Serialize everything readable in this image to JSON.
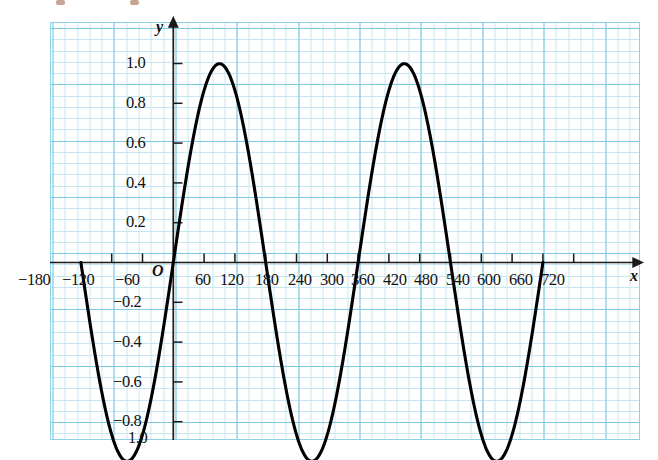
{
  "figure": {
    "axis_names": {
      "x": "x",
      "y": "y"
    },
    "origin_label": "O"
  },
  "chart_data": {
    "type": "line",
    "title": "",
    "subtitle": "",
    "xlabel": "x",
    "ylabel": "y",
    "function": "y = sin(x)",
    "units": "degrees",
    "grid": true,
    "grid_style": "graph-paper",
    "legend": "none",
    "xlim": [
      -180,
      720
    ],
    "ylim": [
      -1.0,
      1.0
    ],
    "xticks": [
      -180,
      -120,
      -60,
      0,
      60,
      120,
      180,
      240,
      300,
      360,
      420,
      480,
      540,
      600,
      660,
      720
    ],
    "xtick_labels": [
      "−180",
      "−120",
      "−60",
      "",
      "60",
      "120",
      "180",
      "240",
      "300",
      "360",
      "420",
      "480",
      "540",
      "600",
      "660",
      "720"
    ],
    "yticks": [
      -1.0,
      -0.8,
      -0.6,
      -0.4,
      -0.2,
      0.2,
      0.4,
      0.6,
      0.8,
      1.0
    ],
    "ytick_labels": [
      "−1.0",
      "−0.8",
      "−0.6",
      "−0.4",
      "−0.2",
      "0.2",
      "0.4",
      "0.6",
      "0.8",
      "1.0"
    ],
    "series": [
      {
        "name": "y = sin(x)",
        "color": "#000000",
        "x": [
          -180,
          -170,
          -160,
          -150,
          -140,
          -130,
          -120,
          -110,
          -100,
          -90,
          -80,
          -70,
          -60,
          -50,
          -40,
          -30,
          -20,
          -10,
          0,
          10,
          20,
          30,
          40,
          50,
          60,
          70,
          80,
          90,
          100,
          110,
          120,
          130,
          140,
          150,
          160,
          170,
          180,
          190,
          200,
          210,
          220,
          230,
          240,
          250,
          260,
          270,
          280,
          290,
          300,
          310,
          320,
          330,
          340,
          350,
          360,
          370,
          380,
          390,
          400,
          410,
          420,
          430,
          440,
          450,
          460,
          470,
          480,
          490,
          500,
          510,
          520,
          530,
          540,
          550,
          560,
          570,
          580,
          590,
          600,
          610,
          620,
          630,
          640,
          650,
          660,
          670,
          680,
          690,
          700,
          710,
          720
        ],
        "y": [
          0.0,
          -0.174,
          -0.342,
          -0.5,
          -0.643,
          -0.766,
          -0.866,
          -0.94,
          -0.985,
          -1.0,
          -0.985,
          -0.94,
          -0.866,
          -0.766,
          -0.643,
          -0.5,
          -0.342,
          -0.174,
          0.0,
          0.174,
          0.342,
          0.5,
          0.643,
          0.766,
          0.866,
          0.94,
          0.985,
          1.0,
          0.985,
          0.94,
          0.866,
          0.766,
          0.643,
          0.5,
          0.342,
          0.174,
          0.0,
          -0.174,
          -0.342,
          -0.5,
          -0.643,
          -0.766,
          -0.866,
          -0.94,
          -0.985,
          -1.0,
          -0.985,
          -0.94,
          -0.866,
          -0.766,
          -0.643,
          -0.5,
          -0.342,
          -0.174,
          0.0,
          0.174,
          0.342,
          0.5,
          0.643,
          0.766,
          0.866,
          0.94,
          0.985,
          1.0,
          0.985,
          0.94,
          0.866,
          0.766,
          0.643,
          0.5,
          0.342,
          0.174,
          0.0,
          -0.174,
          -0.342,
          -0.5,
          -0.643,
          -0.766,
          -0.866,
          -0.94,
          -0.985,
          -1.0,
          -0.985,
          -0.94,
          -0.866,
          -0.766,
          -0.643,
          -0.5,
          -0.342,
          -0.174,
          0.0
        ]
      }
    ],
    "key_points": {
      "maxima": [
        {
          "x": 90,
          "y": 1.0
        },
        {
          "x": 450,
          "y": 1.0
        }
      ],
      "minima": [
        {
          "x": -90,
          "y": -1.0
        },
        {
          "x": 270,
          "y": -1.0
        },
        {
          "x": 630,
          "y": -1.0
        }
      ],
      "zeros": [
        -180,
        0,
        180,
        360,
        540,
        720
      ]
    }
  },
  "x_tick_labels": [
    {
      "value": -180,
      "text": "−180"
    },
    {
      "value": -120,
      "text": "−120"
    },
    {
      "value": -60,
      "text": "−60"
    },
    {
      "value": 60,
      "text": "60"
    },
    {
      "value": 120,
      "text": "120"
    },
    {
      "value": 180,
      "text": "180"
    },
    {
      "value": 240,
      "text": "240"
    },
    {
      "value": 300,
      "text": "300"
    },
    {
      "value": 360,
      "text": "360"
    },
    {
      "value": 420,
      "text": "420"
    },
    {
      "value": 480,
      "text": "480"
    },
    {
      "value": 540,
      "text": "540"
    },
    {
      "value": 600,
      "text": "600"
    },
    {
      "value": 660,
      "text": "660"
    },
    {
      "value": 720,
      "text": "720"
    }
  ],
  "y_tick_labels": [
    {
      "value": 1.0,
      "text": "1.0"
    },
    {
      "value": 0.8,
      "text": "0.8"
    },
    {
      "value": 0.6,
      "text": "0.6"
    },
    {
      "value": 0.4,
      "text": "0.4"
    },
    {
      "value": 0.2,
      "text": "0.2"
    },
    {
      "value": -0.2,
      "text": "−0.2"
    },
    {
      "value": -0.4,
      "text": "−0.4"
    },
    {
      "value": -0.6,
      "text": "−0.6"
    },
    {
      "value": -0.8,
      "text": "−0.8"
    },
    {
      "value": -1.0,
      "text": "1.0"
    }
  ],
  "colors": {
    "curve": "#000000",
    "axis": "#1a1a1a",
    "grid_minor": "#c6e6f2",
    "grid_major": "#7fc9e0",
    "paper": "#ffffff"
  }
}
